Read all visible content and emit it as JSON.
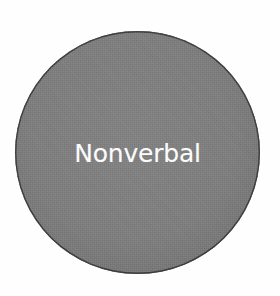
{
  "figure": {
    "type": "single-node-diagram",
    "background_color": "#fefefe",
    "width": 280,
    "height": 296
  },
  "node": {
    "shape": "circle",
    "label": "Nonverbal",
    "fill_color": "#7d7d7d",
    "outline_color": "#3b3b3b",
    "label_color": "#fbfbfb",
    "center_x": 137,
    "center_y": 153,
    "diameter": 245
  }
}
